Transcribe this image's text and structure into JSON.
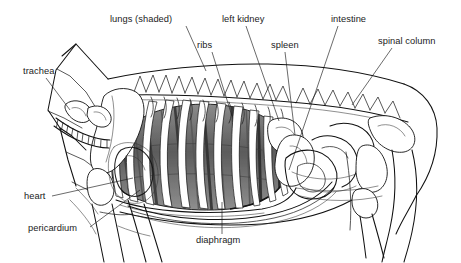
{
  "figure": {
    "background_color": "#ffffff",
    "line_color": "#111111",
    "shading_color": "#6f6f6f",
    "view": "left lateral"
  },
  "labels": [
    {
      "id": "lungs",
      "text": "lungs (shaded)",
      "text_x": 110,
      "text_y": 22,
      "anchor": "start",
      "leader": "M 186 26 L 206 71",
      "target_structure": "lungs"
    },
    {
      "id": "trachea",
      "text": "trachea",
      "text_x": 23,
      "text_y": 74,
      "anchor": "start",
      "leader": "M 46 78 L 70 110",
      "target_structure": "trachea"
    },
    {
      "id": "ribs",
      "text": "ribs",
      "text_x": 197,
      "text_y": 48,
      "anchor": "start",
      "leader": "M 212 52 L 232 116",
      "target_structure": "ribs"
    },
    {
      "id": "left-kidney",
      "text": "left kidney",
      "text_x": 222,
      "text_y": 22,
      "anchor": "start",
      "leader": "M 246 26 L 279 121",
      "target_structure": "left kidney"
    },
    {
      "id": "spleen",
      "text": "spleen",
      "text_x": 271,
      "text_y": 48,
      "anchor": "start",
      "leader": "M 285 52 L 295 135",
      "target_structure": "spleen"
    },
    {
      "id": "intestine",
      "text": "intestine",
      "text_x": 331,
      "text_y": 22,
      "anchor": "start",
      "leader": "M 338 26 L 289 170",
      "target_structure": "intestine"
    },
    {
      "id": "spinal-column",
      "text": "spinal column",
      "text_x": 378,
      "text_y": 44,
      "anchor": "start",
      "leader": "M 392 48 L 352 105",
      "target_structure": "spinal column"
    },
    {
      "id": "heart",
      "text": "heart",
      "text_x": 24,
      "text_y": 199,
      "anchor": "start",
      "leader": "M 52 196 L 133 178",
      "target_structure": "heart"
    },
    {
      "id": "pericardium",
      "text": "pericardium",
      "text_x": 28,
      "text_y": 231,
      "anchor": "start",
      "leader": "M 90 227 L 140 190",
      "target_structure": "pericardium"
    },
    {
      "id": "diaphragm",
      "text": "diaphragm",
      "text_x": 196,
      "text_y": 243,
      "anchor": "start",
      "leader": "M 222 234 L 222 202",
      "target_structure": "diaphragm"
    }
  ],
  "structures": [
    {
      "id": "body-outline",
      "name": "body outline"
    },
    {
      "id": "neck-outline",
      "name": "neck outline"
    },
    {
      "id": "spinal-column",
      "name": "spinal column"
    },
    {
      "id": "ribcage",
      "name": "ribcage"
    },
    {
      "id": "lungs",
      "name": "lungs (shaded)"
    },
    {
      "id": "trachea",
      "name": "trachea"
    },
    {
      "id": "heart",
      "name": "heart"
    },
    {
      "id": "pericardium",
      "name": "pericardium"
    },
    {
      "id": "diaphragm",
      "name": "diaphragm"
    },
    {
      "id": "spleen",
      "name": "spleen"
    },
    {
      "id": "left-kidney",
      "name": "left kidney"
    },
    {
      "id": "intestine",
      "name": "intestine"
    },
    {
      "id": "scapula",
      "name": "scapula"
    },
    {
      "id": "foreleg",
      "name": "foreleg"
    },
    {
      "id": "hindleg",
      "name": "hindleg"
    },
    {
      "id": "pelvis",
      "name": "pelvis"
    }
  ]
}
